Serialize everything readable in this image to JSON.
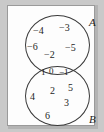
{
  "figure": {
    "type": "venn-diagram",
    "sets": [
      {
        "id": "A",
        "label": "A",
        "position": "top",
        "exclusive_members": [
          "−4",
          "−3",
          "−6",
          "−5",
          "−2"
        ]
      },
      {
        "id": "B",
        "label": "B",
        "position": "bottom",
        "exclusive_members": [
          "4",
          "2",
          "5",
          "3",
          "6"
        ]
      }
    ],
    "intersection": {
      "members": [
        "1",
        "0",
        "−1"
      ]
    },
    "colors": {
      "page_background": "#c9c9c9",
      "plate_background": "#fdfdfd",
      "plate_border": "#9a9a9a",
      "circle_stroke": "#3a3a3a",
      "text": "#1d1d1d"
    }
  }
}
